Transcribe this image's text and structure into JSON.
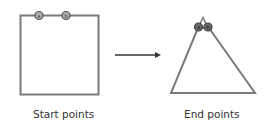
{
  "diagram": {
    "start": {
      "caption": "Start points",
      "shape": "square",
      "points": [
        {
          "label": "a"
        },
        {
          "label": "b"
        }
      ]
    },
    "end": {
      "caption": "End points",
      "shape": "triangle",
      "points": [
        {
          "label": "a"
        },
        {
          "label": "b"
        }
      ]
    },
    "arrow": {
      "direction": "right"
    },
    "colors": {
      "stroke": "#7a7a7a",
      "point_fill": "#9a9a9a",
      "point_dark": "#555555",
      "arrow": "#333333",
      "text": "#333333"
    }
  }
}
